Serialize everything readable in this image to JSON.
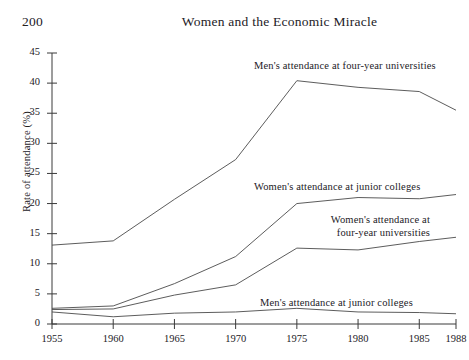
{
  "page": {
    "folio": "200",
    "running_head": "Women and the Economic Miracle"
  },
  "chart_data": {
    "type": "line",
    "title": "",
    "xlabel": "",
    "ylabel": "Rate of attendance (%)",
    "x": [
      1955,
      1960,
      1965,
      1970,
      1975,
      1980,
      1985,
      1988
    ],
    "xlim": [
      1955,
      1988
    ],
    "ylim": [
      0,
      45
    ],
    "xticks": [
      "1955",
      "1960",
      "1965",
      "1970",
      "1975",
      "1980",
      "1985",
      "1988"
    ],
    "yticks": [
      "0",
      "5",
      "10",
      "15",
      "20",
      "25",
      "30",
      "35",
      "40",
      "45"
    ],
    "grid": false,
    "legend_position": "inline-annotations",
    "series": [
      {
        "name": "Men's attendance at four-year universities",
        "values": [
          13.1,
          13.8,
          20.7,
          27.3,
          40.4,
          39.3,
          38.6,
          35.5
        ]
      },
      {
        "name": "Women's attendance at junior colleges",
        "values": [
          2.6,
          3.0,
          6.7,
          11.2,
          20.0,
          21.0,
          20.8,
          21.5
        ]
      },
      {
        "name": "Women's attendance at four-year universities",
        "values": [
          2.4,
          2.5,
          4.8,
          6.5,
          12.6,
          12.3,
          13.7,
          14.4
        ]
      },
      {
        "name": "Men's attendance at junior colleges",
        "values": [
          2.0,
          1.2,
          1.8,
          2.0,
          2.6,
          2.0,
          1.9,
          1.7
        ]
      }
    ],
    "annotations": [
      {
        "id": "men-four-year-label",
        "text": "Men's attendance at four-year universities"
      },
      {
        "id": "women-junior-label",
        "text": "Women's attendance at junior colleges"
      },
      {
        "id": "women-four-year-label-line1",
        "text": "Women's attendance at"
      },
      {
        "id": "women-four-year-label-line2",
        "text": "four-year universities"
      },
      {
        "id": "men-junior-label",
        "text": "Men's attendance at junior colleges"
      }
    ],
    "axis_color": "#3a3a3a",
    "line_color": "#4a4a4a"
  }
}
